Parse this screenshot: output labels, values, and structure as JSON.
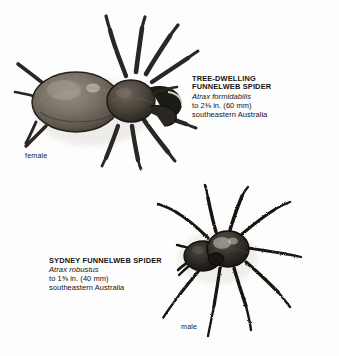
{
  "plate": {
    "background_color": "#fdfdfd",
    "ink_color": "#16130f",
    "medium": "halftone engraving"
  },
  "specimens": [
    {
      "id": "tree-dwelling-funnelweb-spider",
      "common_name": "TREE-DWELLING\nFUNNELWEB SPIDER",
      "title_line_1": "TREE-DWELLING",
      "title_line_2": "FUNNELWEB SPIDER",
      "scientific_name": "Atrax formidabilis",
      "size_line": "to 2⅜ in. (60 mm)",
      "range_line": "southeastern Australia",
      "sex_label": "female",
      "body_tone": "#6f6a63",
      "leg_tone": "#2e2a25"
    },
    {
      "id": "sydney-funnelweb-spider",
      "common_name": "SYDNEY FUNNELWEB SPIDER",
      "title_line_1": "SYDNEY FUNNELWEB SPIDER",
      "title_line_2": "",
      "scientific_name": "Atrax robustus",
      "size_line": "to 1⅝ in. (40 mm)",
      "range_line": "southeastern Australia",
      "sex_label": "male",
      "body_tone": "#34302b",
      "leg_tone": "#201d19"
    }
  ]
}
